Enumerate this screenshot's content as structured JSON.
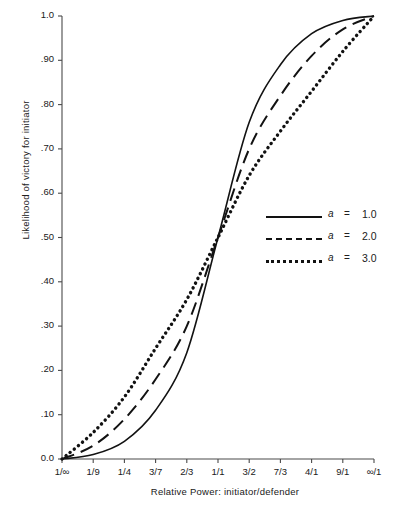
{
  "chart_data": {
    "type": "line",
    "title": "",
    "xlabel": "Relative Power: initiator/defender",
    "ylabel": "Likelihood of victory for initiator",
    "grid": false,
    "legend_position": "right-middle",
    "categories": [
      "1/∞",
      "1/9",
      "1/4",
      "3/7",
      "2/3",
      "1/1",
      "3/2",
      "7/3",
      "4/1",
      "9/1",
      "∞/1"
    ],
    "x_tick_labels": [
      "1/∞",
      "1/9",
      "1/4",
      "3/7",
      "2/3",
      "1/1",
      "3/2",
      "7/3",
      "4/1",
      "9/1",
      "∞/1"
    ],
    "y_tick_labels": [
      "0.0",
      ".10",
      ".20",
      ".30",
      ".40",
      ".50",
      ".60",
      ".70",
      ".80",
      ".90",
      "1.0"
    ],
    "y_tick_values": [
      0.0,
      0.1,
      0.2,
      0.3,
      0.4,
      0.5,
      0.6,
      0.7,
      0.8,
      0.9,
      1.0
    ],
    "ylim": [
      0.0,
      1.0
    ],
    "xlim": [
      0,
      10
    ],
    "series": [
      {
        "name": "a = 1.0",
        "symbol": "a",
        "equals": "=",
        "value": "1.0",
        "style": "solid",
        "color": "#121212",
        "values": [
          0.0,
          0.01,
          0.04,
          0.11,
          0.24,
          0.5,
          0.76,
          0.89,
          0.96,
          0.99,
          1.0
        ]
      },
      {
        "name": "a = 2.0",
        "symbol": "a",
        "equals": "=",
        "value": "2.0",
        "style": "dashed",
        "color": "#121212",
        "values": [
          0.0,
          0.03,
          0.09,
          0.18,
          0.3,
          0.5,
          0.7,
          0.82,
          0.91,
          0.97,
          1.0
        ]
      },
      {
        "name": "a = 3.0",
        "symbol": "a",
        "equals": "=",
        "value": "3.0",
        "style": "dotted",
        "color": "#121212",
        "values": [
          0.0,
          0.06,
          0.14,
          0.25,
          0.36,
          0.5,
          0.64,
          0.74,
          0.83,
          0.92,
          1.0
        ]
      }
    ]
  },
  "legend": {
    "entries": [
      {
        "symbol": "a",
        "equals": "=",
        "value": "1.0"
      },
      {
        "symbol": "a",
        "equals": "=",
        "value": "2.0"
      },
      {
        "symbol": "a",
        "equals": "=",
        "value": "3.0"
      }
    ]
  },
  "axes": {
    "y_title": "Likelihood of victory for initiator",
    "x_title": "Relative Power: initiator/defender"
  },
  "colors": {
    "line": "#121212",
    "axis": "#4a4a4a",
    "text": "#202020",
    "background": "#ffffff"
  }
}
